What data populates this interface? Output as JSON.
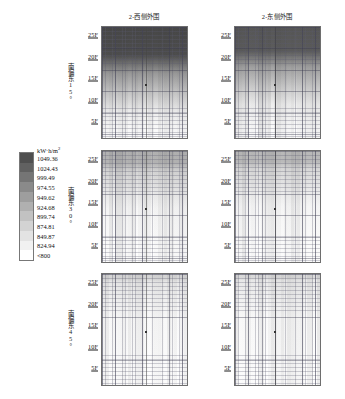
{
  "figure": {
    "column_titles": [
      "2-西侧外围",
      "2-东侧外围"
    ],
    "row_labels": [
      "南偏东15°",
      "南偏东30°",
      "南偏东45°"
    ],
    "floor_ticks": [
      "25F",
      "20F",
      "15F",
      "10F",
      "5F"
    ]
  },
  "legend": {
    "unit": "kW·h/m²",
    "unit_base": "kW·h/m",
    "unit_sup": "2",
    "values": [
      "1049.36",
      "1024.43",
      "999.49",
      "974.55",
      "949.62",
      "924.68",
      "899.74",
      "874.81",
      "849.87",
      "824.94",
      "<800"
    ],
    "colors": [
      "#4f4f4f",
      "#616161",
      "#757575",
      "#8a8a8a",
      "#9e9e9e",
      "#b0b0b0",
      "#c2c2c2",
      "#d3d3d3",
      "#e3e3e3",
      "#f1f1f1",
      "#ffffff"
    ]
  },
  "chart_data": {
    "type": "heatmap",
    "title": "",
    "xlabel": "",
    "ylabel": "楼层",
    "grid": true,
    "legend_position": "left-middle",
    "colorbar": {
      "unit": "kW·h/m²",
      "breaks": [
        1049.36,
        1024.43,
        999.49,
        974.55,
        949.62,
        924.68,
        899.74,
        874.81,
        849.87,
        824.94,
        800
      ],
      "below_min_label": "<800"
    },
    "y_axis": {
      "ticks": [
        "5F",
        "10F",
        "15F",
        "20F",
        "25F"
      ],
      "range": [
        1,
        28
      ]
    },
    "panels": [
      {
        "row": "南偏东15°",
        "column": "2-西侧外围",
        "top_value": 1049.36,
        "bottom_value": 812.0,
        "mean_value": 935.0,
        "dark_fraction_top": 0.42
      },
      {
        "row": "南偏东15°",
        "column": "2-东侧外围",
        "top_value": 1040.0,
        "bottom_value": 805.0,
        "mean_value": 915.0,
        "dark_fraction_top": 0.36
      },
      {
        "row": "南偏东30°",
        "column": "2-西侧外围",
        "top_value": 905.0,
        "bottom_value": 800.0,
        "mean_value": 838.0,
        "dark_fraction_top": 0.18
      },
      {
        "row": "南偏东30°",
        "column": "2-东侧外围",
        "top_value": 898.0,
        "bottom_value": 800.0,
        "mean_value": 832.0,
        "dark_fraction_top": 0.16
      },
      {
        "row": "南偏东45°",
        "column": "2-西侧外围",
        "top_value": 852.0,
        "bottom_value": 800.0,
        "mean_value": 812.0,
        "dark_fraction_top": 0.08
      },
      {
        "row": "南偏东45°",
        "column": "2-东侧外围",
        "top_value": 848.0,
        "bottom_value": 800.0,
        "mean_value": 810.0,
        "dark_fraction_top": 0.07
      }
    ]
  }
}
